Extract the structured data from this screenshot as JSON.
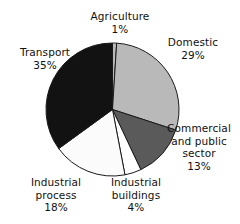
{
  "chart_data": {
    "type": "pie",
    "title": "",
    "subtitle": "",
    "xlabel": "",
    "ylabel": "",
    "legend_position": "none",
    "grid": false,
    "units": "percent",
    "total": 100,
    "start_angle_deg": 0,
    "direction": "clockwise",
    "categories": [
      "Agriculture",
      "Domestic",
      "Commercial and public sector",
      "Industrial buildings",
      "Industrial process",
      "Transport"
    ],
    "values": [
      1,
      29,
      13,
      4,
      18,
      35
    ],
    "slices": [
      {
        "label": "Agriculture",
        "value": 1,
        "value_text": "1%",
        "color": "#b9b9b9",
        "stroke": "#1a1a1a"
      },
      {
        "label": "Domestic",
        "value": 29,
        "value_text": "29%",
        "color": "#b9b9b9",
        "stroke": "#1a1a1a"
      },
      {
        "label": "Commercial and public sector",
        "value": 13,
        "value_text": "13%",
        "color": "#5a5a5a",
        "stroke": "#1a1a1a"
      },
      {
        "label": "Industrial buildings",
        "value": 4,
        "value_text": "4%",
        "color": "#ffffff",
        "stroke": "#1a1a1a"
      },
      {
        "label": "Industrial process",
        "value": 18,
        "value_text": "18%",
        "color": "#fbfbfb",
        "stroke": "#1a1a1a"
      },
      {
        "label": "Transport",
        "value": 35,
        "value_text": "35%",
        "color": "#121212",
        "stroke": "#1a1a1a"
      }
    ]
  },
  "labels": {
    "agriculture": {
      "name": "Agriculture",
      "pct": "1%"
    },
    "domestic": {
      "name": "Domestic",
      "pct": "29%"
    },
    "transport": {
      "name": "Transport",
      "pct": "35%"
    },
    "commercial": {
      "line1": "Commercial",
      "line2": "and public",
      "line3": "sector",
      "pct": "13%"
    },
    "industrial_buildings": {
      "line1": "Industrial",
      "line2": "buildings",
      "pct": "4%"
    },
    "industrial_process": {
      "line1": "Industrial",
      "line2": "process",
      "pct": "18%"
    }
  },
  "colors": {
    "background": "#ffffff",
    "text": "#111111",
    "slice_light_gray": "#b9b9b9",
    "slice_dark_gray": "#5a5a5a",
    "slice_white": "#ffffff",
    "slice_black": "#121212",
    "outline": "#1a1a1a"
  }
}
